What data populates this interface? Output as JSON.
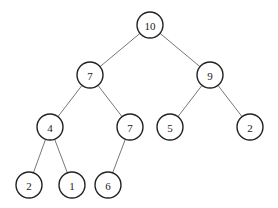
{
  "tree": {
    "nodes": [
      {
        "id": "n0",
        "label": "10",
        "x": 150,
        "y": 25
      },
      {
        "id": "n1",
        "label": "7",
        "x": 90,
        "y": 75
      },
      {
        "id": "n2",
        "label": "9",
        "x": 210,
        "y": 75
      },
      {
        "id": "n3",
        "label": "4",
        "x": 50,
        "y": 127
      },
      {
        "id": "n4",
        "label": "7",
        "x": 130,
        "y": 127
      },
      {
        "id": "n5",
        "label": "5",
        "x": 170,
        "y": 127
      },
      {
        "id": "n6",
        "label": "2",
        "x": 250,
        "y": 127
      },
      {
        "id": "n7",
        "label": "2",
        "x": 29,
        "y": 185
      },
      {
        "id": "n8",
        "label": "1",
        "x": 72,
        "y": 185
      },
      {
        "id": "n9",
        "label": "6",
        "x": 108,
        "y": 185
      }
    ],
    "edges": [
      [
        "n0",
        "n1"
      ],
      [
        "n0",
        "n2"
      ],
      [
        "n1",
        "n3"
      ],
      [
        "n1",
        "n4"
      ],
      [
        "n2",
        "n5"
      ],
      [
        "n2",
        "n6"
      ],
      [
        "n3",
        "n7"
      ],
      [
        "n3",
        "n8"
      ],
      [
        "n4",
        "n9"
      ]
    ],
    "radius": 13
  }
}
